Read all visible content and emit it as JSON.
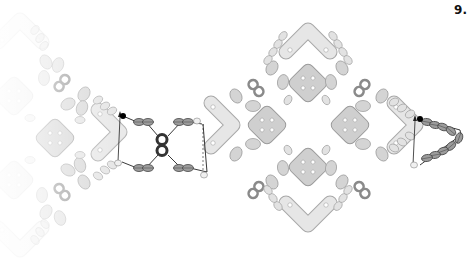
{
  "diagram": {
    "step_number": "9.",
    "type": "beadwork pattern step illustration",
    "colors": {
      "background": "#ffffff",
      "tile_fill": "#cfcfcf",
      "tile_stroke": "#9a9a9a",
      "seed_fill": "#d8d8d8",
      "seed_stroke": "#a8a8a8",
      "active_bead_fill": "#9a9a9a",
      "active_bead_stroke": "#444444",
      "thread": "#222222",
      "start_dot": "#000000",
      "twin_bead": "#8a8a8a",
      "twin_bead_active": "#333333"
    },
    "elements": {
      "square_tiles": 6,
      "chevron_beads": 6,
      "twin_hole_beads": 8,
      "thread_paths": 2
    }
  }
}
